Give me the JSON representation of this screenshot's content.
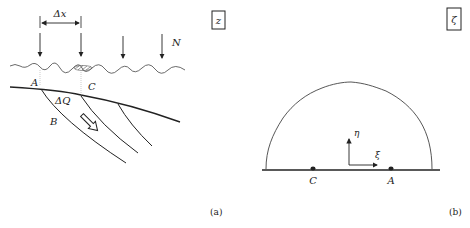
{
  "figure": {
    "panel_a": {
      "box_label": "z",
      "delta_x_label": "Δx",
      "flow_label": "N",
      "point_a_label": "A",
      "point_c_label": "C",
      "point_b_label": "B",
      "delta_q_label": "ΔQ",
      "caption": "(a)"
    },
    "panel_b": {
      "box_label": "ζ",
      "point_c_label": "C",
      "point_a_label": "A",
      "axis_eta_label": "η",
      "axis_xi_label": "ξ",
      "caption": "(b)"
    },
    "colors": {
      "ink": "#222222",
      "light_ink": "#666666",
      "background": "#ffffff"
    }
  }
}
